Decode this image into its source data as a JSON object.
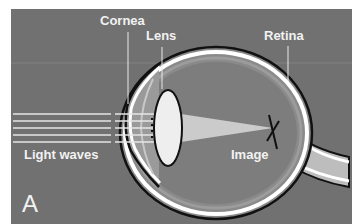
{
  "figure": {
    "panel_letter": "A",
    "labels": {
      "cornea": "Cornea",
      "lens": "Lens",
      "retina": "Retina",
      "light_waves": "Light waves",
      "image": "Image"
    },
    "colors": {
      "background": "#717171",
      "border": "#ffffff",
      "label_text": "#f2f2f2",
      "eye_wall": "#ffffff",
      "outline": "#111111"
    }
  }
}
